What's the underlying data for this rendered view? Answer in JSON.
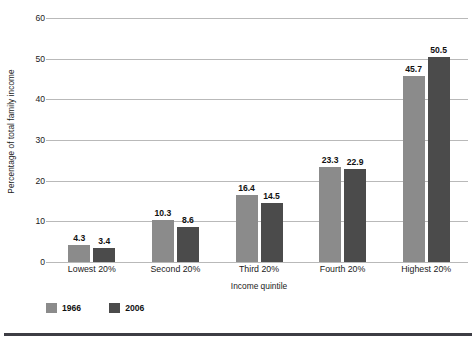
{
  "chart_data": {
    "type": "bar",
    "title": "",
    "xlabel": "Income quintile",
    "ylabel": "Percentage of total family income",
    "categories": [
      "Lowest 20%",
      "Second 20%",
      "Third 20%",
      "Fourth 20%",
      "Highest 20%"
    ],
    "series": [
      {
        "name": "1966",
        "color": "#8b8b8b",
        "values": [
          4.3,
          10.3,
          16.4,
          23.3,
          45.7
        ],
        "labels": [
          "4.3",
          "10.3",
          "16.4",
          "23.3",
          "45.7"
        ]
      },
      {
        "name": "2006",
        "color": "#4b4b4b",
        "values": [
          3.4,
          8.6,
          14.5,
          22.9,
          50.5
        ],
        "labels": [
          "3.4",
          "8.6",
          "14.5",
          "22.9",
          "50.5"
        ]
      }
    ],
    "ylim": [
      0,
      60
    ],
    "yticks": [
      0,
      10,
      20,
      30,
      40,
      50,
      60
    ],
    "ytick_labels": [
      "0",
      "10",
      "20",
      "30",
      "40",
      "50",
      "60"
    ],
    "grid": "horizontal",
    "legend_position": "bottom-left",
    "gridline_color": "#b9b9b9",
    "background_color": "#ffffff",
    "text_color": "#1a1a1a"
  }
}
